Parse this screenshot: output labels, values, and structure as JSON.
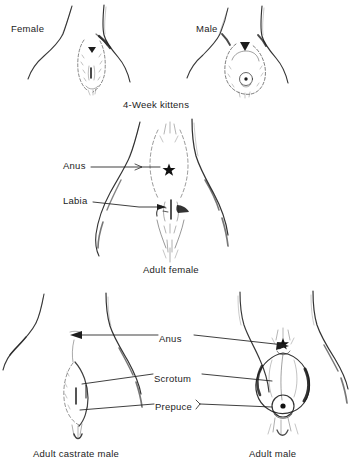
{
  "figure": {
    "background_color": "#ffffff",
    "ink_color": "#1a1a1a",
    "panels": [
      {
        "id": "four-week-kittens",
        "caption": "4-Week kittens",
        "labels": [
          "Female",
          "Male"
        ]
      },
      {
        "id": "adult-female",
        "caption": "Adult female",
        "labels": [
          "Anus",
          "Labia"
        ]
      },
      {
        "id": "adult-males",
        "captions": [
          "Adult castrate male",
          "Adult male"
        ],
        "labels": [
          "Anus",
          "Scrotum",
          "Prepuce"
        ]
      }
    ]
  },
  "kittens": {
    "female_label": "Female",
    "male_label": "Male",
    "caption": "4-Week kittens"
  },
  "adult_female": {
    "caption": "Adult female",
    "anus_label": "Anus",
    "labia_label": "Labia"
  },
  "adult_males": {
    "anus_label": "Anus",
    "scrotum_label": "Scrotum",
    "prepuce_label": "Prepuce",
    "castrate_caption": "Adult castrate male",
    "intact_caption": "Adult male"
  }
}
